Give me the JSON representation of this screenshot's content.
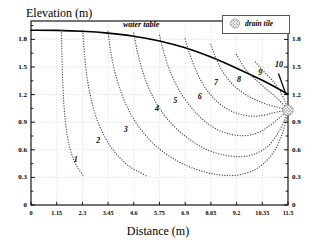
{
  "chart_data": {
    "type": "line",
    "title": "",
    "xlabel": "Distance (m)",
    "ylabel": "Elevation (m)",
    "xlim": [
      0,
      11.5
    ],
    "ylim": [
      0,
      2.0
    ],
    "grid": true,
    "xticks": [
      "0",
      "1.15",
      "2.3",
      "3.45",
      "4.6",
      "5.75",
      "6.9",
      "8.05",
      "9.2",
      "10.35",
      "11.5"
    ],
    "xtick_values": [
      0,
      1.15,
      2.3,
      3.45,
      4.6,
      5.75,
      6.9,
      8.05,
      9.2,
      10.35,
      11.5
    ],
    "yticks": [
      "0",
      "0.3",
      "0.6",
      "0.9",
      "1.2",
      "1.5",
      "1.8"
    ],
    "ytick_values": [
      0,
      0.3,
      0.6,
      0.9,
      1.2,
      1.5,
      1.8
    ],
    "yticks_right": [
      "0",
      "0.3",
      "0.6",
      "0.9",
      "1.2",
      "1.5",
      "1.8"
    ],
    "legend_position": "top-right",
    "legend": [
      {
        "label": "drain tile",
        "marker": "stippled-circle",
        "color": "#9a9a9a"
      }
    ],
    "annotations": [
      {
        "text": "water table",
        "x": 5.1,
        "y": 1.96,
        "style": "italic"
      },
      {
        "text": "10",
        "x": 11.05,
        "y": 1.52,
        "style": "italic",
        "leader": true
      }
    ],
    "series": [
      {
        "name": "water table",
        "style": "solid",
        "color": "#000000",
        "width": 1.6,
        "points": [
          [
            0.0,
            1.9
          ],
          [
            1.15,
            1.898
          ],
          [
            2.3,
            1.888
          ],
          [
            3.45,
            1.868
          ],
          [
            4.6,
            1.835
          ],
          [
            5.75,
            1.783
          ],
          [
            6.9,
            1.708
          ],
          [
            8.05,
            1.608
          ],
          [
            9.2,
            1.487
          ],
          [
            10.35,
            1.355
          ],
          [
            11.0,
            1.272
          ],
          [
            11.5,
            1.205
          ]
        ]
      },
      {
        "name": "streamline 1",
        "label": "1",
        "label_x": 2.05,
        "label_y": 0.49,
        "style": "dotted",
        "color": "#444444",
        "points": [
          [
            1.36,
            1.897
          ],
          [
            1.38,
            1.7
          ],
          [
            1.4,
            1.5
          ],
          [
            1.43,
            1.3
          ],
          [
            1.47,
            1.1
          ],
          [
            1.53,
            0.92
          ],
          [
            1.62,
            0.76
          ],
          [
            1.74,
            0.62
          ],
          [
            1.9,
            0.5
          ],
          [
            2.1,
            0.4
          ],
          [
            2.32,
            0.325
          ],
          [
            2.3,
            0.3
          ]
        ]
      },
      {
        "name": "streamline 2",
        "label": "2",
        "label_x": 3.05,
        "label_y": 0.7,
        "style": "dotted",
        "color": "#444444",
        "points": [
          [
            2.32,
            1.893
          ],
          [
            2.38,
            1.68
          ],
          [
            2.46,
            1.48
          ],
          [
            2.58,
            1.28
          ],
          [
            2.74,
            1.1
          ],
          [
            2.95,
            0.93
          ],
          [
            3.22,
            0.78
          ],
          [
            3.55,
            0.64
          ],
          [
            3.95,
            0.52
          ],
          [
            4.4,
            0.42
          ],
          [
            4.9,
            0.35
          ],
          [
            5.2,
            0.31
          ]
        ]
      },
      {
        "name": "streamline 3",
        "label": "3",
        "label_x": 4.28,
        "label_y": 0.82,
        "style": "dotted",
        "color": "#444444",
        "points": [
          [
            3.45,
            1.884
          ],
          [
            3.56,
            1.68
          ],
          [
            3.72,
            1.48
          ],
          [
            3.94,
            1.29
          ],
          [
            4.22,
            1.11
          ],
          [
            4.58,
            0.94
          ],
          [
            5.02,
            0.79
          ],
          [
            5.55,
            0.65
          ],
          [
            6.2,
            0.53
          ],
          [
            6.95,
            0.43
          ],
          [
            7.75,
            0.36
          ],
          [
            8.55,
            0.325
          ],
          [
            9.25,
            0.325
          ],
          [
            9.9,
            0.37
          ],
          [
            10.45,
            0.46
          ],
          [
            10.92,
            0.6
          ],
          [
            11.25,
            0.78
          ],
          [
            11.44,
            0.95
          ],
          [
            11.5,
            1.03
          ]
        ]
      },
      {
        "name": "streamline 4",
        "label": "4",
        "label_x": 5.68,
        "label_y": 1.04,
        "style": "dotted",
        "color": "#444444",
        "points": [
          [
            4.6,
            1.869
          ],
          [
            4.75,
            1.68
          ],
          [
            4.95,
            1.49
          ],
          [
            5.22,
            1.3
          ],
          [
            5.58,
            1.12
          ],
          [
            6.02,
            0.96
          ],
          [
            6.55,
            0.82
          ],
          [
            7.18,
            0.7
          ],
          [
            7.88,
            0.6
          ],
          [
            8.62,
            0.545
          ],
          [
            9.35,
            0.525
          ],
          [
            10.02,
            0.555
          ],
          [
            10.6,
            0.64
          ],
          [
            11.05,
            0.78
          ],
          [
            11.33,
            0.92
          ],
          [
            11.5,
            1.03
          ]
        ]
      },
      {
        "name": "streamline 5",
        "label": "5",
        "label_x": 6.5,
        "label_y": 1.13,
        "style": "dotted",
        "color": "#444444",
        "points": [
          [
            5.75,
            1.845
          ],
          [
            5.92,
            1.68
          ],
          [
            6.15,
            1.5
          ],
          [
            6.45,
            1.33
          ],
          [
            6.83,
            1.17
          ],
          [
            7.28,
            1.03
          ],
          [
            7.8,
            0.905
          ],
          [
            8.38,
            0.815
          ],
          [
            9.0,
            0.765
          ],
          [
            9.62,
            0.755
          ],
          [
            10.2,
            0.79
          ],
          [
            10.7,
            0.865
          ],
          [
            11.1,
            0.945
          ],
          [
            11.38,
            1.005
          ],
          [
            11.5,
            1.03
          ]
        ]
      },
      {
        "name": "streamline 6",
        "label": "6",
        "label_x": 7.6,
        "label_y": 1.17,
        "style": "dotted",
        "color": "#444444",
        "points": [
          [
            6.9,
            1.805
          ],
          [
            7.08,
            1.66
          ],
          [
            7.32,
            1.5
          ],
          [
            7.62,
            1.345
          ],
          [
            7.98,
            1.215
          ],
          [
            8.4,
            1.11
          ],
          [
            8.88,
            1.03
          ],
          [
            9.38,
            0.985
          ],
          [
            9.88,
            0.965
          ],
          [
            10.38,
            0.975
          ],
          [
            10.82,
            1.0
          ],
          [
            11.2,
            1.02
          ],
          [
            11.5,
            1.03
          ]
        ]
      },
      {
        "name": "streamline 7",
        "label": "7",
        "label_x": 8.32,
        "label_y": 1.33,
        "style": "dotted",
        "color": "#444444",
        "points": [
          [
            8.05,
            1.745
          ],
          [
            8.22,
            1.63
          ],
          [
            8.44,
            1.51
          ],
          [
            8.72,
            1.4
          ],
          [
            9.05,
            1.305
          ],
          [
            9.42,
            1.23
          ],
          [
            9.82,
            1.17
          ],
          [
            10.22,
            1.125
          ],
          [
            10.62,
            1.09
          ],
          [
            11.0,
            1.065
          ],
          [
            11.3,
            1.045
          ],
          [
            11.5,
            1.03
          ]
        ]
      },
      {
        "name": "streamline 8",
        "label": "8",
        "label_x": 9.35,
        "label_y": 1.36,
        "style": "dotted",
        "color": "#444444",
        "points": [
          [
            9.2,
            1.635
          ],
          [
            9.38,
            1.555
          ],
          [
            9.6,
            1.475
          ],
          [
            9.88,
            1.4
          ],
          [
            10.2,
            1.33
          ],
          [
            10.55,
            1.255
          ],
          [
            10.88,
            1.19
          ],
          [
            11.18,
            1.12
          ],
          [
            11.4,
            1.065
          ],
          [
            11.5,
            1.03
          ]
        ]
      },
      {
        "name": "streamline 9",
        "label": "9",
        "label_x": 10.3,
        "label_y": 1.43,
        "style": "dotted",
        "color": "#444444",
        "points": [
          [
            10.05,
            1.555
          ],
          [
            10.25,
            1.495
          ],
          [
            10.5,
            1.43
          ],
          [
            10.78,
            1.36
          ],
          [
            11.02,
            1.285
          ],
          [
            11.24,
            1.195
          ],
          [
            11.4,
            1.105
          ],
          [
            11.5,
            1.03
          ]
        ]
      },
      {
        "name": "streamline 10",
        "label": "10",
        "label_x": 11.05,
        "label_y": 1.52,
        "style": "solid-leader",
        "color": "#000000",
        "points": [
          [
            11.08,
            1.425
          ],
          [
            11.22,
            1.33
          ],
          [
            11.33,
            1.255
          ],
          [
            11.4,
            1.205
          ]
        ]
      }
    ],
    "markers": [
      {
        "name": "drain tile",
        "x": 11.5,
        "y": 1.03,
        "shape": "circle",
        "r": 5.2,
        "color": "#9a9a9a"
      }
    ]
  }
}
